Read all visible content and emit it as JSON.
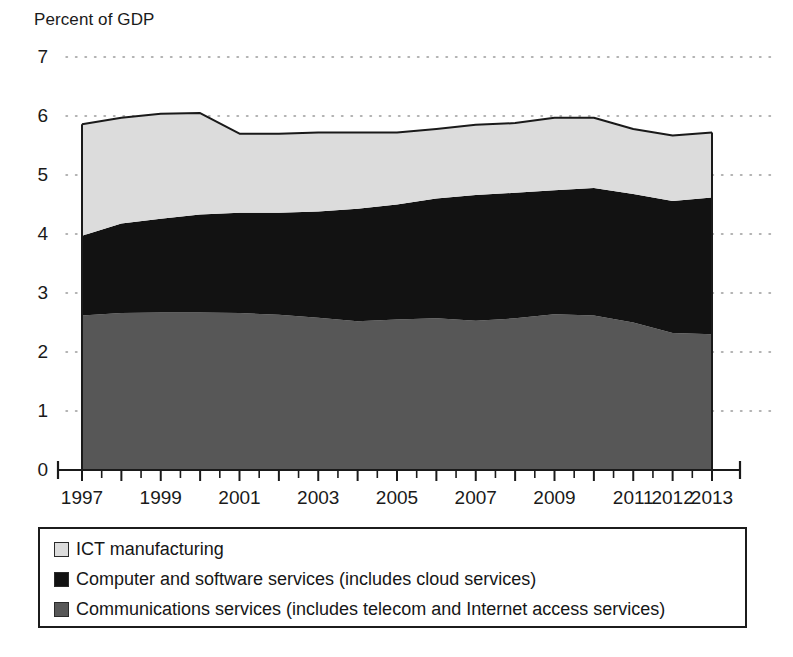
{
  "chart_data": {
    "type": "area",
    "stacked": true,
    "title": "",
    "subtitle": "",
    "ylabel": "Percent of GDP",
    "xlabel": "",
    "ylim": [
      0,
      7
    ],
    "ytick_step": 1,
    "ytick_labels": [
      "0",
      "1",
      "2",
      "3",
      "4",
      "5",
      "6",
      "7"
    ],
    "grid": "horizontal-dotted",
    "legend_position": "below-plot",
    "x": [
      1997,
      1998,
      1999,
      2000,
      2001,
      2002,
      2003,
      2004,
      2005,
      2006,
      2007,
      2008,
      2009,
      2010,
      2011,
      2012,
      2013
    ],
    "xtick_labels": [
      "1997",
      "1999",
      "2001",
      "2003",
      "2005",
      "2007",
      "2009",
      "2011",
      "2012",
      "2013"
    ],
    "xtick_label_values": [
      1997,
      1999,
      2001,
      2003,
      2005,
      2007,
      2009,
      2011,
      2012,
      2013
    ],
    "series": [
      {
        "name": "Communications services (includes telecom and Internet access services)",
        "color": "#575757",
        "values": [
          2.62,
          2.66,
          2.67,
          2.67,
          2.66,
          2.63,
          2.58,
          2.52,
          2.55,
          2.57,
          2.53,
          2.57,
          2.64,
          2.62,
          2.5,
          2.32,
          2.3
        ]
      },
      {
        "name": "Computer and software services (includes cloud services)",
        "color": "#121212",
        "values": [
          1.35,
          1.52,
          1.59,
          1.66,
          1.7,
          1.73,
          1.8,
          1.91,
          1.95,
          2.03,
          2.13,
          2.13,
          2.1,
          2.16,
          2.18,
          2.24,
          2.32
        ]
      },
      {
        "name": "ICT manufacturing",
        "color": "#dcdcdc",
        "values": [
          1.89,
          1.79,
          1.78,
          1.72,
          1.34,
          1.34,
          1.34,
          1.29,
          1.22,
          1.18,
          1.19,
          1.18,
          1.23,
          1.19,
          1.1,
          1.11,
          1.1
        ]
      }
    ],
    "cumulative_totals": [
      5.86,
      5.97,
      6.04,
      6.05,
      5.7,
      5.7,
      5.72,
      5.72,
      5.72,
      5.78,
      5.85,
      5.88,
      5.97,
      5.97,
      5.78,
      5.67,
      5.72
    ],
    "notable_points": [
      {
        "year": 2000,
        "total": 6.05,
        "note": "peak of total ICT share"
      },
      {
        "year": 2001,
        "total": 5.7,
        "note": "drop after dot-com peak"
      },
      {
        "year": 2010,
        "total": 5.97,
        "note": "secondary peak"
      },
      {
        "year": 2013,
        "total": 5.72,
        "note": "final value"
      }
    ]
  },
  "legend": {
    "items": [
      {
        "label": "ICT manufacturing",
        "color": "#dcdcdc"
      },
      {
        "label": "Computer and software services (includes cloud services)",
        "color": "#121212"
      },
      {
        "label": "Communications services (includes telecom and Internet access services)",
        "color": "#575757"
      }
    ]
  },
  "axis": {
    "y_title": "Percent of GDP"
  }
}
